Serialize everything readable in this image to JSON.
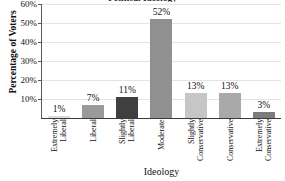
{
  "chart_data": {
    "type": "bar",
    "title": "Political Ideology",
    "xlabel": "Ideology",
    "ylabel": "Percentage of Voters",
    "categories": [
      "Extremely Liberal",
      "Liberal",
      "Slightly Liberal",
      "Moderate",
      "Slightly Conservative",
      "Conservative",
      "Extremely Conservative"
    ],
    "category_lines": [
      [
        "Extremely",
        "Liberal"
      ],
      [
        "Liberal"
      ],
      [
        "Slightly",
        "Liberal"
      ],
      [
        "Moderate"
      ],
      [
        "Slightly",
        "Conservative"
      ],
      [
        "Conservative"
      ],
      [
        "Extremely",
        "Conservative"
      ]
    ],
    "values": [
      1,
      7,
      11,
      52,
      13,
      13,
      3
    ],
    "value_labels": [
      "1%",
      "7%",
      "11%",
      "52%",
      "13%",
      "13%",
      "3%"
    ],
    "bar_colors": [
      "#dcdcdc",
      "#9a9a9a",
      "#3f3f3f",
      "#909090",
      "#c6c6c6",
      "#a9a9a9",
      "#7c7c7c"
    ],
    "ylim": [
      0,
      60
    ],
    "yticks": [
      10,
      20,
      30,
      40,
      50,
      60
    ],
    "ytick_labels": [
      "10%",
      "20%",
      "30%",
      "40%",
      "50%",
      "60%"
    ],
    "grid": true,
    "legend": false
  }
}
